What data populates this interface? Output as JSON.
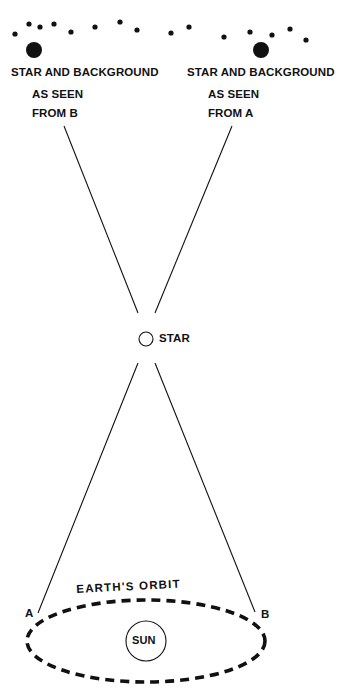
{
  "diagram": {
    "type": "stellar-parallax",
    "left_view": {
      "line1": "STAR AND BACKGROUND",
      "line2": "AS SEEN",
      "line3": "FROM B"
    },
    "right_view": {
      "line1": "STAR AND BACKGROUND",
      "line2": "AS SEEN",
      "line3": "FROM A"
    },
    "star_label": "STAR",
    "orbit_label": "EARTH'S ORBIT",
    "sun_label": "SUN",
    "point_a": "A",
    "point_b": "B",
    "colors": {
      "ink": "#111111",
      "background": "#ffffff"
    }
  }
}
